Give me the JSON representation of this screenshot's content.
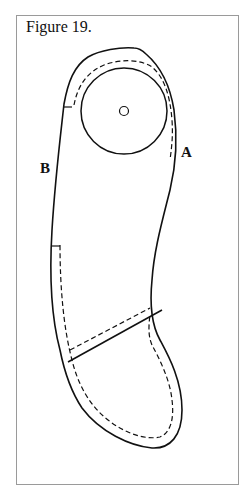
{
  "figure": {
    "title": "Figure 19.",
    "labels": {
      "a": "A",
      "b": "B"
    }
  }
}
